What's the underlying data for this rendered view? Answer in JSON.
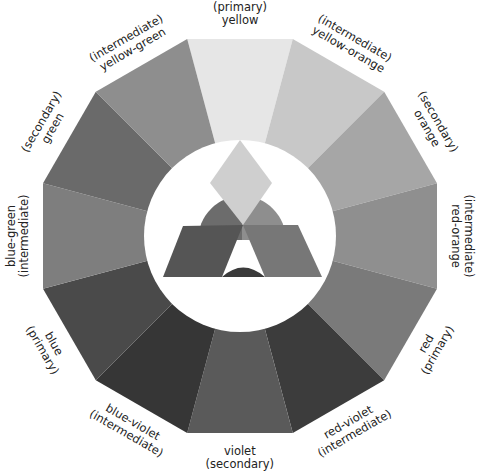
{
  "center": {
    "x": 240,
    "y": 236
  },
  "radii": {
    "outer": 204,
    "inner_circle": 96
  },
  "wedges": [
    {
      "name": "yellow",
      "role": "primary",
      "label_top": "(primary)",
      "label_bottom": "yellow",
      "angle": -90,
      "color": "#e6e6e6"
    },
    {
      "name": "yellow-orange",
      "role": "intermediate",
      "label_top": "(intermediate)",
      "label_bottom": "yellow-orange",
      "angle": -60,
      "color": "#c8c8c8"
    },
    {
      "name": "orange",
      "role": "secondary",
      "label_top": "(secondary)",
      "label_bottom": "orange",
      "angle": -30,
      "color": "#a6a6a6"
    },
    {
      "name": "red-orange",
      "role": "intermediate",
      "label_top": "(intermediate)",
      "label_bottom": "red-orange",
      "angle": 0,
      "color": "#8f8f8f"
    },
    {
      "name": "red",
      "role": "primary",
      "label_top": "red",
      "label_bottom": "(primary)",
      "angle": 30,
      "color": "#7a7a7a"
    },
    {
      "name": "red-violet",
      "role": "intermediate",
      "label_top": "red-violet",
      "label_bottom": "(intermediate)",
      "angle": 60,
      "color": "#3c3c3c"
    },
    {
      "name": "violet",
      "role": "secondary",
      "label_top": "violet",
      "label_bottom": "(secondary)",
      "angle": 90,
      "color": "#5a5a5a"
    },
    {
      "name": "blue-violet",
      "role": "intermediate",
      "label_top": "blue-violet",
      "label_bottom": "(intermediate)",
      "angle": 120,
      "color": "#363636"
    },
    {
      "name": "blue",
      "role": "primary",
      "label_top": "blue",
      "label_bottom": "(primary)",
      "angle": 150,
      "color": "#4a4a4a"
    },
    {
      "name": "blue-green",
      "role": "intermediate",
      "label_top": "blue-green",
      "label_bottom": "(intermediate)",
      "angle": 180,
      "color": "#7e7e7e"
    },
    {
      "name": "green",
      "role": "secondary",
      "label_top": "(secondary)",
      "label_bottom": "green",
      "angle": 210,
      "color": "#6a6a6a"
    },
    {
      "name": "yellow-green",
      "role": "intermediate",
      "label_top": "(intermediate)",
      "label_bottom": "yellow-green",
      "angle": 240,
      "color": "#8e8e8e"
    }
  ],
  "center_shapes": {
    "diamond_color": "#cfcfcf",
    "dome_left_color": "#6c6c6c",
    "dome_right_color": "#8e8e8e",
    "trap_left_color": "#555555",
    "trap_right_color": "#777777",
    "arch_color": "#3a3a3a"
  }
}
